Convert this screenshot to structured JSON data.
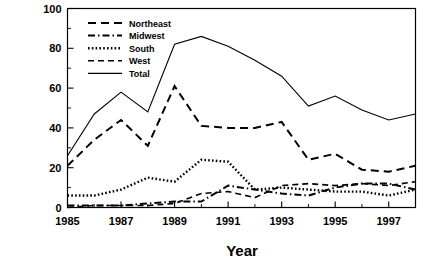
{
  "chart_data": {
    "type": "line",
    "title": "",
    "xlabel": "Year",
    "ylabel": "Number",
    "xlim": [
      1985,
      1998
    ],
    "ylim": [
      0,
      100
    ],
    "ytick_step": 20,
    "ytick_minor_step": 10,
    "xtick_step": 2,
    "xtick_minor_step": 1,
    "grid": false,
    "legend_position": "top-left",
    "x": [
      1985,
      1986,
      1987,
      1988,
      1989,
      1990,
      1991,
      1992,
      1993,
      1994,
      1995,
      1996,
      1997,
      1998
    ],
    "xtick_labels": [
      "1985",
      "1987",
      "1989",
      "1991",
      "1993",
      "1995",
      "1997"
    ],
    "ytick_labels": [
      "0",
      "20",
      "40",
      "60",
      "80",
      "100"
    ],
    "series": [
      {
        "name": "Northeast",
        "dash": "8,5",
        "width": 2.0,
        "values": [
          21,
          34,
          44,
          31,
          61,
          41,
          40,
          40,
          43,
          24,
          27,
          19,
          18,
          21
        ]
      },
      {
        "name": "Midwest",
        "dash": "7,3,1.5,3",
        "width": 2.0,
        "values": [
          1,
          1,
          1,
          2,
          3,
          3,
          11,
          9,
          7,
          6,
          10,
          12,
          12,
          9
        ]
      },
      {
        "name": "South",
        "dash": "1.6,2.2",
        "width": 2.4,
        "values": [
          6,
          6,
          9,
          15,
          13,
          24,
          23,
          9,
          10,
          9,
          8,
          8,
          6,
          9
        ]
      },
      {
        "name": "West",
        "dash": "6,4",
        "width": 1.6,
        "values": [
          0,
          1,
          1,
          1,
          2,
          7,
          8,
          5,
          11,
          12,
          11,
          12,
          11,
          13
        ]
      },
      {
        "name": "Total",
        "dash": "none",
        "width": 1.1,
        "values": [
          26,
          47,
          58,
          48,
          82,
          86,
          81,
          74,
          66,
          51,
          56,
          49,
          44,
          47
        ]
      }
    ]
  },
  "axis": {
    "y_label": "Number",
    "x_label": "Year"
  },
  "legend": {
    "items": [
      {
        "label": "Northeast"
      },
      {
        "label": "Midwest"
      },
      {
        "label": "South"
      },
      {
        "label": "West"
      },
      {
        "label": "Total"
      }
    ]
  },
  "caption": {
    "text": ""
  }
}
